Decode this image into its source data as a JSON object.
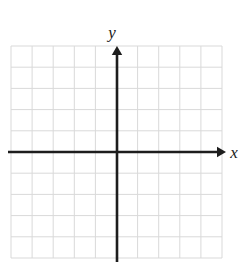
{
  "figure": {
    "name": "blank-cartesian-coordinate-grid",
    "width": 248,
    "height": 270,
    "background_color": "#ffffff"
  },
  "grid": {
    "columns": 10,
    "rows": 10,
    "left": 11,
    "top": 46,
    "right": 222,
    "bottom": 258,
    "cell_width": 21.1,
    "cell_height": 21.2,
    "line_color": "#d9d9d9",
    "line_width": 1
  },
  "axes": {
    "origin_x": 117,
    "origin_y": 152,
    "line_color": "#1d1d1d",
    "line_width": 2.6,
    "x_axis": {
      "label": "x",
      "start_x": 8,
      "end_x": 226,
      "y": 152,
      "label_x": 234,
      "label_y": 158,
      "arrow": "right",
      "arrow_size": 9
    },
    "y_axis": {
      "label": "y",
      "x": 117,
      "start_y": 262,
      "end_y": 46,
      "label_x": 112,
      "label_y": 38,
      "arrow": "up",
      "arrow_size": 9
    }
  },
  "chart_data": {
    "type": "scatter",
    "title": "",
    "xlabel": "x",
    "ylabel": "y",
    "series": [
      {
        "name": "plotted-points",
        "x": [],
        "y": []
      }
    ],
    "xlim": [
      -5,
      5
    ],
    "ylim": [
      -5,
      5
    ],
    "xticks": [
      -5,
      -4,
      -3,
      -2,
      -1,
      0,
      1,
      2,
      3,
      4,
      5
    ],
    "yticks": [
      -5,
      -4,
      -3,
      -2,
      -1,
      0,
      1,
      2,
      3,
      4,
      5
    ],
    "xtick_labels": [
      "",
      "",
      "",
      "",
      "",
      "",
      "",
      "",
      "",
      "",
      ""
    ],
    "ytick_labels": [
      "",
      "",
      "",
      "",
      "",
      "",
      "",
      "",
      "",
      "",
      ""
    ],
    "grid": true,
    "legend": false
  }
}
